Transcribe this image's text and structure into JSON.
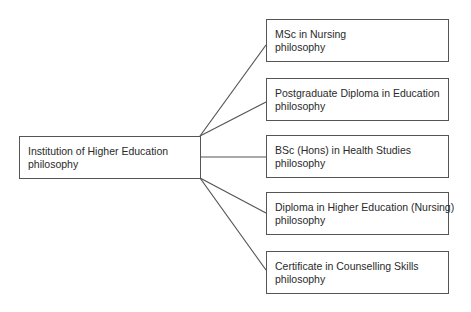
{
  "root": {
    "line1": "Institution of Higher Education",
    "line2": "philosophy"
  },
  "children": [
    {
      "line1": "MSc in Nursing",
      "line2": "philosophy"
    },
    {
      "line1": "Postgraduate Diploma in Education",
      "line2": "philosophy"
    },
    {
      "line1": "BSc (Hons) in Health Studies",
      "line2": "philosophy"
    },
    {
      "line1": "Diploma in Higher Education (Nursing)",
      "line2": "philosophy"
    },
    {
      "line1": "Certificate in Counselling Skills",
      "line2": "philosophy"
    }
  ],
  "colors": {
    "line": "#555555",
    "text": "#2a2a2a"
  }
}
